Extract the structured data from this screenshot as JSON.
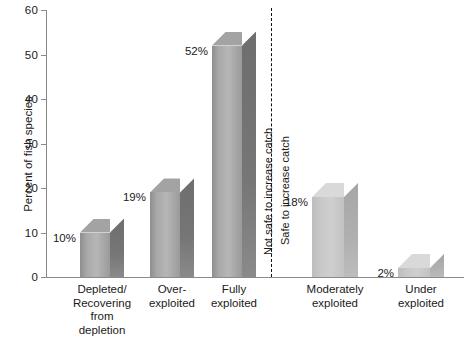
{
  "chart_data": {
    "type": "bar",
    "title": "",
    "subtitle": "",
    "xlabel": "",
    "ylabel": "Percent of fish species",
    "ylim": [
      0,
      60
    ],
    "ytick_step": 10,
    "yticks": [
      "0",
      "10",
      "20",
      "30",
      "40",
      "50",
      "60"
    ],
    "grid": false,
    "legend": null,
    "categories": [
      "Depleted/\nRecovering\nfrom\ndepletion",
      "Over-\nexploited",
      "Fully\nexploited",
      "Moderately\nexploited",
      "Under\nexploited"
    ],
    "values": [
      10,
      19,
      52,
      18,
      2
    ],
    "data_labels": [
      "10%",
      "19%",
      "52%",
      "18%",
      "2%"
    ],
    "annotations": [
      {
        "name": "not-safe-divider-label",
        "text": "Not safe to increase catch",
        "orientation": "vertical",
        "side": "left-of-divider"
      },
      {
        "name": "safe-divider-label",
        "text": "Safe to increase catch",
        "orientation": "vertical",
        "side": "right-of-divider"
      }
    ],
    "divider": {
      "style": "dashed",
      "after_category_index": 2
    },
    "colors": {
      "background": "#ffffff",
      "axis": "#8a8a8a",
      "text": "#1a1a1a",
      "bar_dark_front": "#a8a8a8",
      "bar_dark_side": "#767676",
      "bar_dark_top": "#a3a3a3",
      "bar_light_front": "#c9c9c9",
      "bar_light_side": "#b0b0b0",
      "bar_light_top": "#d9d9d9",
      "divider": "#111111"
    }
  },
  "axis": {
    "y_title": "Percent of fish species",
    "ticks": [
      {
        "label": "60",
        "value": 60
      },
      {
        "label": "50",
        "value": 50
      },
      {
        "label": "40",
        "value": 40
      },
      {
        "label": "30",
        "value": 30
      },
      {
        "label": "20",
        "value": 20
      },
      {
        "label": "10",
        "value": 10
      },
      {
        "label": "0",
        "value": 0
      }
    ]
  },
  "bars": [
    {
      "label": "10%",
      "category": "Depleted/\nRecovering\nfrom\ndepletion",
      "value": 10
    },
    {
      "label": "19%",
      "category": "Over-\nexploited",
      "value": 19
    },
    {
      "label": "52%",
      "category": "Fully\nexploited",
      "value": 52
    },
    {
      "label": "18%",
      "category": "Moderately\nexploited",
      "value": 18
    },
    {
      "label": "2%",
      "category": "Under\nexploited",
      "value": 2
    }
  ],
  "divider_labels": {
    "not_safe": "Not safe to increase catch",
    "safe": "Safe to increase catch"
  }
}
